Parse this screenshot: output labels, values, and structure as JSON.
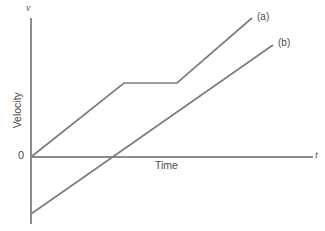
{
  "chart_data": {
    "type": "line",
    "title": "",
    "subtitle": "",
    "xlabel": "Time",
    "ylabel": "Velocity",
    "x_axis_symbol": "t",
    "y_axis_symbol": "v",
    "origin_label": "0",
    "grid": false,
    "legend_position": "inline-end-of-line",
    "xlim": [
      0,
      10
    ],
    "ylim": [
      -2.5,
      7.5
    ],
    "axes": {
      "x_tick_labels": [],
      "y_tick_labels": [],
      "show_ticks": false,
      "arrow_x": true,
      "arrow_y": true
    },
    "annotations": [
      {
        "text": "(a)",
        "x": 8.0,
        "y": 7.0
      },
      {
        "text": "(b)",
        "x": 8.7,
        "y": 6.2
      }
    ],
    "series": [
      {
        "name": "(a)",
        "label": "(a)",
        "color": "#7d7d7d",
        "description": "Starts at origin, rises with constant acceleration, holds constant velocity, then rises again at the same rate",
        "points": [
          {
            "x": 0.0,
            "y": 0.0
          },
          {
            "x": 3.3,
            "y": 3.5
          },
          {
            "x": 5.2,
            "y": 3.5
          },
          {
            "x": 7.85,
            "y": 6.6
          }
        ]
      },
      {
        "name": "(b)",
        "label": "(b)",
        "color": "#7d7d7d",
        "description": "Starts at a negative velocity and increases linearly at a constant rate, crossing zero partway along the time axis",
        "points": [
          {
            "x": 0.0,
            "y": -2.7
          },
          {
            "x": 8.6,
            "y": 5.3
          }
        ]
      }
    ],
    "pixel_geometry": {
      "y_axis_x": 31,
      "y_axis_top": 18,
      "y_axis_bottom": 224,
      "x_axis_y": 157,
      "x_axis_left": 31,
      "x_axis_right": 313,
      "series_a_path": "31,157 124,83 177,83 252,18",
      "series_b_path": "31,214 273,45"
    }
  }
}
